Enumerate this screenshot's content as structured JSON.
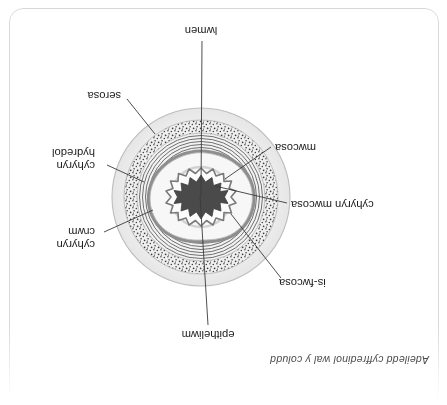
{
  "page": {
    "title": "Adeiledd cyffredinol wal y coludd",
    "orientation": "rotated-180",
    "background_color": "#ffffff",
    "border_color": "#d8d8d8"
  },
  "diagram": {
    "type": "cross-section",
    "colors": {
      "serosa_fill": "#efefef",
      "stipple": "#3c3c3c",
      "muscle_line": "#6f6f6f",
      "submucosa_fill": "#f4f4f4",
      "mucosa_band": "#8e8e8e",
      "epithelium_outline": "#7a7a7a",
      "lumen_fill": "#4a4a4a",
      "leader_line": "#3a3a3a"
    },
    "labels": [
      {
        "id": "epitheliwm",
        "text": "epitheliwm",
        "position": "top",
        "lines": 1
      },
      {
        "id": "is-fwcosa",
        "text": "is-fwcosa",
        "position": "upper-left",
        "lines": 1
      },
      {
        "id": "cyhyryn-mwcosa",
        "text": "cyhyryn mwcosa",
        "position": "left",
        "lines": 1
      },
      {
        "id": "mwcosa",
        "text": "mwcosa",
        "position": "lower-left",
        "lines": 1
      },
      {
        "id": "cyhyryn-crwm",
        "text": "cyhyryn crwm",
        "position": "upper-right",
        "lines": 2,
        "line1": "cyhyryn",
        "line2": "crwm"
      },
      {
        "id": "cyhyryn-hydredol",
        "text": "cyhyryn hydredol",
        "position": "right",
        "lines": 2,
        "line1": "cyhyryn",
        "line2": "hydredol"
      },
      {
        "id": "serosa",
        "text": "serosa",
        "position": "lower-right",
        "lines": 1
      },
      {
        "id": "lwmen",
        "text": "lwmen",
        "position": "bottom",
        "lines": 1
      }
    ]
  }
}
